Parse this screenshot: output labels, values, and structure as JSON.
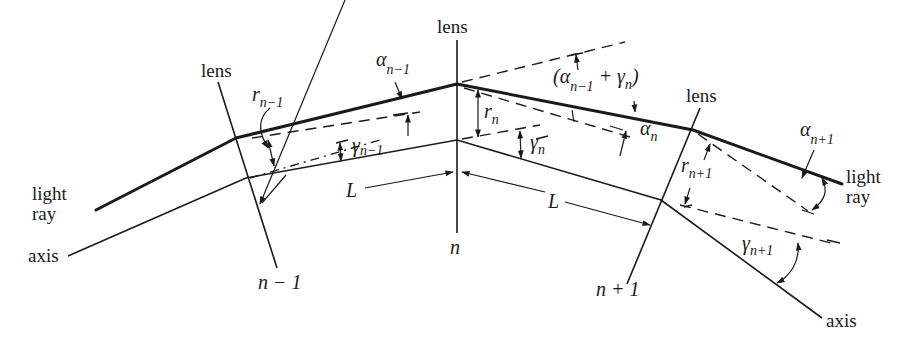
{
  "diagram": {
    "labels": {
      "lens_left": "lens",
      "lens_center": "lens",
      "lens_right": "lens",
      "light_ray_left_1": "light",
      "light_ray_left_2": "ray",
      "light_ray_right_1": "light",
      "light_ray_right_2": "ray",
      "axis_left": "axis",
      "axis_right": "axis",
      "lens_index_left": "n − 1",
      "lens_index_center": "n",
      "lens_index_right": "n + 1",
      "spacing_left": "L",
      "spacing_right": "L"
    },
    "symbols": {
      "r_prev": {
        "base": "r",
        "sub": "n−1"
      },
      "r_n": {
        "base": "r",
        "sub": "n"
      },
      "r_next": {
        "base": "r",
        "sub": "n+1"
      },
      "alpha_prev": {
        "base": "α",
        "sub": "n−1"
      },
      "alpha_n": {
        "base": "α",
        "sub": "n"
      },
      "alpha_next": {
        "base": "α",
        "sub": "n+1"
      },
      "gamma_prev": {
        "base": "γ",
        "sub": "n−1"
      },
      "gamma_n": {
        "base": "γ",
        "sub": "n"
      },
      "gamma_next": {
        "base": "γ",
        "sub": "n+1"
      },
      "sum_open": "(α",
      "sum_sub": "n−1",
      "sum_plus": " + γ",
      "sum_sub2": "n",
      "sum_close": ")"
    },
    "colors": {
      "ink": "#1a1a1a",
      "background": "#ffffff"
    }
  }
}
